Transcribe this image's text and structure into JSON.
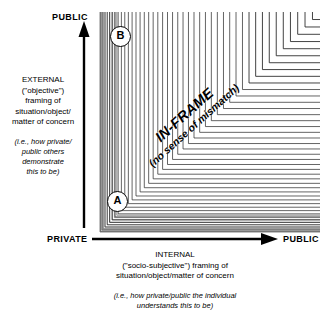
{
  "diagram": {
    "axes": {
      "vertical": {
        "top_label": "PUBLIC",
        "bottom_label": "PRIVATE",
        "caption_lines": [
          "EXTERNAL",
          "(\"objective\")",
          "framing of",
          "situation/object/",
          "matter of concern"
        ],
        "caption_italic_lines": [
          "(i.e., how private/",
          "public others",
          "demonstrate",
          "this to be)"
        ]
      },
      "horizontal": {
        "left_label": "PRIVATE",
        "right_label": "PUBLIC",
        "caption_lines": [
          "INTERNAL",
          "(\"socio-subjective\") framing of",
          "situation/object/matter of concern"
        ],
        "caption_italic_lines": [
          "(i.e., how private/public the individual",
          "understands this to be)"
        ]
      }
    },
    "diagonal_label": {
      "line1": "IN-FRAME",
      "line2": "(no sense of mismatch)"
    },
    "markers": [
      {
        "id": "A",
        "label": "A"
      },
      {
        "id": "B",
        "label": "B"
      }
    ],
    "colors": {
      "line": "#222222",
      "line_light": "#888888",
      "background": "#ffffff",
      "text": "#000000"
    }
  },
  "chart_data": {
    "type": "diagram",
    "xlabel": "INTERNAL (\"socio-subjective\") framing of situation/object/matter of concern",
    "ylabel": "EXTERNAL (\"objective\") framing of situation/object/matter of concern",
    "xlim": [
      "PRIVATE",
      "PUBLIC"
    ],
    "ylim": [
      "PRIVATE",
      "PUBLIC"
    ],
    "grid": false,
    "annotations": [
      {
        "text": "IN-FRAME",
        "position": "diagonal"
      },
      {
        "text": "(no sense of mismatch)",
        "position": "diagonal"
      },
      {
        "text": "B",
        "position": "upper-left"
      },
      {
        "text": "A",
        "position": "lower-left"
      }
    ]
  }
}
